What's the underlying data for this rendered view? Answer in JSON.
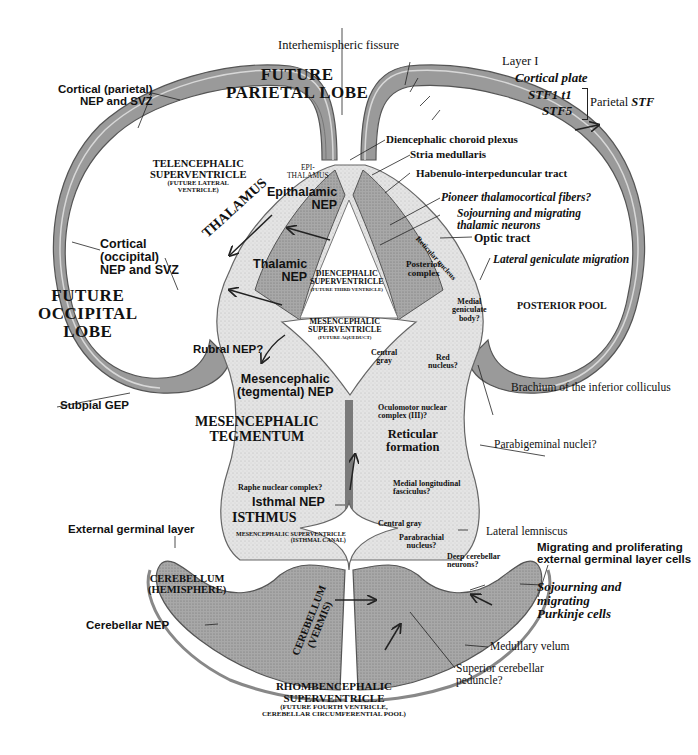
{
  "diagram": {
    "type": "anatomical-cross-section"
  },
  "regions": {
    "future_parietal_lobe": [
      "FUTURE",
      "PARIETAL LOBE"
    ],
    "future_occipital_lobe": [
      "FUTURE",
      "OCCIPITAL",
      "LOBE"
    ],
    "telencephalic_superventricle": [
      "TELENCEPHALIC",
      "SUPERVENTRICLE",
      "(FUTURE LATERAL",
      "VENTRICLE)"
    ],
    "epithalamus": [
      "EPI-",
      "THALAMUS"
    ],
    "thalamus": "THALAMUS",
    "diencephalic_superventricle": [
      "DIENCEPHALIC",
      "SUPERVENTRICLE",
      "(FUTURE THIRD VENTRICLE)"
    ],
    "mesencephalic_superventricle": [
      "MESENCEPHALIC",
      "SUPERVENTRICLE",
      "(FUTURE AQUEDUCT)"
    ],
    "posterior_pool": "POSTERIOR POOL",
    "mesencephalic_tegmentum": [
      "MESENCEPHALIC",
      "TEGMENTUM"
    ],
    "isthmus": "ISTHMUS",
    "isthmal_canal": [
      "MESENCEPHALIC SUPERVENTRICLE",
      "(ISTHMAL CANAL)"
    ],
    "cerebellum_hemisphere": [
      "CEREBELLUM",
      "(HEMISPHERE)"
    ],
    "cerebellum_vermis": [
      "CEREBELLUM",
      "(VERMIS)"
    ],
    "rhombencephalic_superventricle": [
      "RHOMBENCEPHALIC",
      "SUPERVENTRICLE",
      "(FUTURE FOURTH VENTRICLE,",
      "CEREBELLAR CIRCUMFERENTIAL POOL)"
    ]
  },
  "labels_left": {
    "cortical_parietal": [
      "Cortical (parietal)",
      "NEP and SVZ"
    ],
    "epithalamic_nep": [
      "Epithalamic",
      "NEP"
    ],
    "cortical_occipital": [
      "Cortical",
      "(occipital)",
      "NEP and SVZ"
    ],
    "thalamic_nep": [
      "Thalamic",
      "NEP"
    ],
    "rubral_nep": "Rubral NEP?",
    "mesencephalic_nep": [
      "Mesencephalic",
      "(tegmental) NEP"
    ],
    "subpial_gep": "Subpial GEP",
    "raphe": "Raphe nuclear complex?",
    "isthmal_nep": "Isthmal NEP",
    "external_germinal_layer": "External germinal layer",
    "cerebellar_nep": "Cerebellar NEP"
  },
  "labels_top": {
    "interhemispheric_fissure": "Interhemispheric fissure"
  },
  "labels_right": {
    "layer_i": "Layer I",
    "cortical_plate": "Cortical plate",
    "stf1": "STF1 t1",
    "stf5": "STF5",
    "parietal_stf_prefix": "Parietal ",
    "parietal_stf_italic": "STF",
    "diencephalic_choroid_plexus": "Diencephalic choroid plexus",
    "stria_medullaris": "Stria medullaris",
    "habenulo_tract": "Habenulo-interpeduncular tract",
    "pioneer_fibers": "Pioneer thalamocortical fibers?",
    "sojourning_thalamic": [
      "Sojourning and migrating",
      "thalamic neurons"
    ],
    "optic_tract": "Optic tract",
    "reticular_nucleus": "Reticular nucleus",
    "lateral_geniculate_migration": "Lateral geniculate migration",
    "posterior_complex": [
      "Posterior",
      "complex"
    ],
    "medial_geniculate": [
      "Medial",
      "geniculate",
      "body?"
    ],
    "central_gray_upper": [
      "Central",
      "gray"
    ],
    "red_nucleus": [
      "Red",
      "nucleus?"
    ],
    "brachium": "Brachium of the inferior colliculus",
    "oculomotor": [
      "Oculomotor nuclear",
      "complex (III)?"
    ],
    "reticular_formation": [
      "Reticular",
      "formation"
    ],
    "parabigeminal": "Parabigeminal nuclei?",
    "mlf": [
      "Medial longitudinal",
      "fasciculus?"
    ],
    "central_gray_lower": "Central gray",
    "lateral_lemniscus": "Lateral lemniscus",
    "parabrachial": [
      "Parabrachial",
      "nucleus?"
    ],
    "deep_cerebellar": [
      "Deep cerebellar",
      "neurons?"
    ],
    "migrating_egl": [
      "Migrating and proliferating",
      "external germinal layer cells"
    ],
    "sojourning_purkinje": [
      "Sojourning and",
      "migrating",
      "Purkinje cells"
    ],
    "medullary_velum": "Medullary velum",
    "superior_peduncle": [
      "Superior cerebellar",
      "peduncle?"
    ]
  },
  "colors": {
    "tissue_light": "#e6e6e6",
    "tissue_mid": "#c4c4c4",
    "tissue_dark": "#8a8a8a",
    "neuroepithelium": "#6e6e6e",
    "outline": "#555555",
    "text": "#111111",
    "background": "#ffffff"
  }
}
